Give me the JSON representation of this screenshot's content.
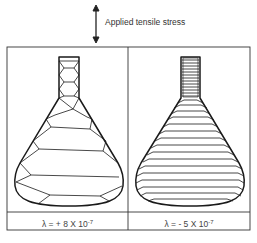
{
  "stress_label": "Applied tensile stress",
  "stress_icon": "double-headed-vertical-arrow",
  "panels": [
    {
      "name": "positive-magnetostriction",
      "caption_prefix": "λ = + 8 X 10",
      "caption_exponent": "-7",
      "domain_pattern": "diamond-closure-domains"
    },
    {
      "name": "negative-magnetostriction",
      "caption_prefix": "λ = - 5 X 10",
      "caption_exponent": "-7",
      "domain_pattern": "horizontal-stripe-domains"
    }
  ],
  "colors": {
    "line": "#1a1a1a",
    "frame": "#333333",
    "background": "#ffffff"
  }
}
